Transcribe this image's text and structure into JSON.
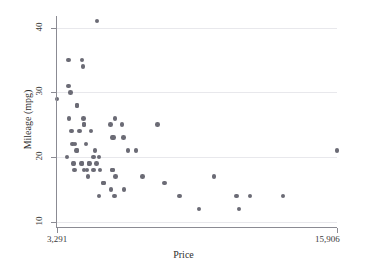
{
  "chart_data": {
    "type": "scatter",
    "title": "",
    "xlabel": "Price",
    "ylabel": "Mileage (mpg)",
    "xlim": [
      3291,
      15906
    ],
    "ylim": [
      9.2,
      41.8
    ],
    "x_tick_values": [
      3291,
      15906
    ],
    "x_tick_labels": [
      "3,291",
      "15,906"
    ],
    "y_tick_values": [
      10,
      20,
      30,
      40
    ],
    "y_tick_labels": [
      "10",
      "20",
      "30",
      "40"
    ],
    "grid": "horizontal",
    "legend": "none",
    "marker_color": "#6b6b75",
    "axis_color": "#8b8b93",
    "grid_color": "#e8e8ec",
    "background": "#ffffff",
    "n_points": 74,
    "points": [
      {
        "x": 3291,
        "y": 29
      },
      {
        "x": 3748,
        "y": 20
      },
      {
        "x": 3798,
        "y": 35
      },
      {
        "x": 3799,
        "y": 31
      },
      {
        "x": 3829,
        "y": 26
      },
      {
        "x": 3895,
        "y": 30
      },
      {
        "x": 3955,
        "y": 24
      },
      {
        "x": 3984,
        "y": 22
      },
      {
        "x": 4010,
        "y": 19
      },
      {
        "x": 4060,
        "y": 19
      },
      {
        "x": 4082,
        "y": 18
      },
      {
        "x": 4099,
        "y": 22
      },
      {
        "x": 4172,
        "y": 21
      },
      {
        "x": 4181,
        "y": 21
      },
      {
        "x": 4187,
        "y": 28
      },
      {
        "x": 4195,
        "y": 28
      },
      {
        "x": 4296,
        "y": 24
      },
      {
        "x": 4389,
        "y": 19
      },
      {
        "x": 4424,
        "y": 19
      },
      {
        "x": 4425,
        "y": 35
      },
      {
        "x": 4453,
        "y": 34
      },
      {
        "x": 4482,
        "y": 26
      },
      {
        "x": 4499,
        "y": 25
      },
      {
        "x": 4504,
        "y": 25
      },
      {
        "x": 4516,
        "y": 18
      },
      {
        "x": 4589,
        "y": 22
      },
      {
        "x": 4647,
        "y": 18
      },
      {
        "x": 4697,
        "y": 17
      },
      {
        "x": 4723,
        "y": 19
      },
      {
        "x": 4749,
        "y": 19
      },
      {
        "x": 4816,
        "y": 24
      },
      {
        "x": 4934,
        "y": 20
      },
      {
        "x": 4941,
        "y": 18
      },
      {
        "x": 5005,
        "y": 21
      },
      {
        "x": 5079,
        "y": 19
      },
      {
        "x": 5104,
        "y": 41
      },
      {
        "x": 5172,
        "y": 14
      },
      {
        "x": 5189,
        "y": 20
      },
      {
        "x": 5222,
        "y": 18
      },
      {
        "x": 5379,
        "y": 16
      },
      {
        "x": 5397,
        "y": 16
      },
      {
        "x": 5705,
        "y": 25
      },
      {
        "x": 5719,
        "y": 15
      },
      {
        "x": 5788,
        "y": 18
      },
      {
        "x": 5798,
        "y": 18
      },
      {
        "x": 5799,
        "y": 23
      },
      {
        "x": 5829,
        "y": 23
      },
      {
        "x": 5886,
        "y": 14
      },
      {
        "x": 5899,
        "y": 26
      },
      {
        "x": 5922,
        "y": 17
      },
      {
        "x": 6229,
        "y": 25
      },
      {
        "x": 6295,
        "y": 23
      },
      {
        "x": 6303,
        "y": 15
      },
      {
        "x": 6486,
        "y": 21
      },
      {
        "x": 6850,
        "y": 21
      },
      {
        "x": 7140,
        "y": 17
      },
      {
        "x": 7827,
        "y": 25
      },
      {
        "x": 8129,
        "y": 16
      },
      {
        "x": 8814,
        "y": 14
      },
      {
        "x": 9690,
        "y": 12
      },
      {
        "x": 10372,
        "y": 17
      },
      {
        "x": 11385,
        "y": 14
      },
      {
        "x": 11497,
        "y": 12
      },
      {
        "x": 11995,
        "y": 14
      },
      {
        "x": 13466,
        "y": 14
      },
      {
        "x": 15906,
        "y": 21
      }
    ]
  }
}
